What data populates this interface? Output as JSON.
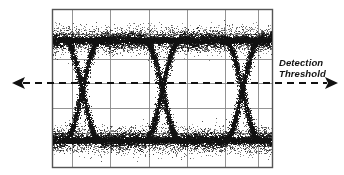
{
  "figure": {
    "kind": "eye-diagram",
    "width": 344,
    "height": 175,
    "background_color": "#ffffff",
    "trace_color": "#111111"
  },
  "annotations": {
    "detection_threshold": {
      "line1": "Detection",
      "line2": "Threshold"
    }
  },
  "threshold_axis": {
    "name": "detection-threshold-axis",
    "y": 83,
    "x_start": 12,
    "x_end": 338,
    "style": "dashed",
    "dash_on": 7,
    "dash_off": 5,
    "line_width": 2.2,
    "color": "#111111",
    "left_arrow": true,
    "right_arrow": true,
    "arrow_length": 13,
    "arrow_half_width": 6
  },
  "graticule": {
    "name": "oscilloscope-graticule",
    "left": 52,
    "right": 272,
    "top": 9,
    "bottom": 167,
    "border_color": "#555555",
    "grid_color": "#888888",
    "border_width": 1.4,
    "grid_width": 0.9,
    "vertical_lines": [
      52,
      72,
      110,
      149,
      187,
      225,
      258,
      272
    ],
    "horizontal_lines": [
      9,
      34,
      59,
      83,
      108,
      133,
      167
    ]
  },
  "chart_data": {
    "type": "scatter",
    "title": "",
    "xlabel": "",
    "ylabel": "",
    "xlim": [
      52,
      272
    ],
    "ylim": [
      9,
      167
    ],
    "grid": true,
    "legend": false,
    "levels": {
      "logic_high_y": 40,
      "logic_low_y": 140,
      "threshold_y": 83
    },
    "noise": {
      "rail_thickness_px": 9,
      "edge_thickness_px": 6,
      "jitter_px": 4,
      "speckle_density": 0.35
    },
    "eye_crossings_x": [
      82,
      163,
      242
    ],
    "unit_interval_px": 80,
    "transition_width_px": 34,
    "points_per_rail": 5200,
    "points_per_edge": 1400,
    "random_seed": 20240517
  }
}
